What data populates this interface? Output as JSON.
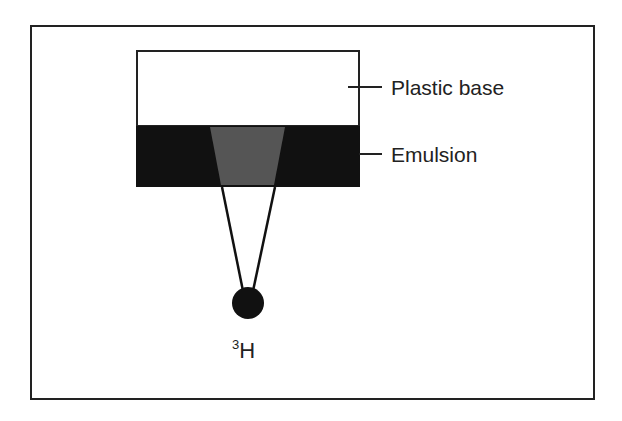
{
  "diagram": {
    "type": "autoradiography-film-cross-section",
    "labels": {
      "plastic_base": "Plastic base",
      "emulsion": "Emulsion"
    },
    "source": {
      "mass_number": "3",
      "symbol": "H"
    },
    "colors": {
      "frame": "#222222",
      "plastic_base": "#ffffff",
      "emulsion": "#111111",
      "exposed_region": "#555555",
      "source_particle": "#111111"
    }
  }
}
